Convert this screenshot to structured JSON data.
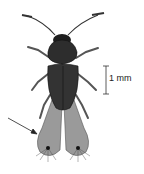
{
  "figure": {
    "scale_bar": {
      "label": "1 mm"
    },
    "annotation": {
      "type": "arrow",
      "target": "fringed-hind-wings"
    },
    "colors": {
      "background": "#ffffff",
      "ink": "#1a1a1a",
      "body_fill": "#2b2b2b",
      "wing_fill": "#8a8a8a"
    }
  }
}
